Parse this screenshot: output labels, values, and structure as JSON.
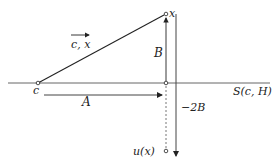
{
  "diagram": {
    "labels": {
      "vector_label": "c, x",
      "point_x": "x",
      "point_c": "c",
      "segment_B": "B",
      "segment_A": "A",
      "neg_2B": "−2B",
      "horizon": "S(c, H)",
      "u_of_x": "u(x)"
    },
    "colors": {
      "ink": "#222222",
      "background": "#ffffff"
    }
  }
}
